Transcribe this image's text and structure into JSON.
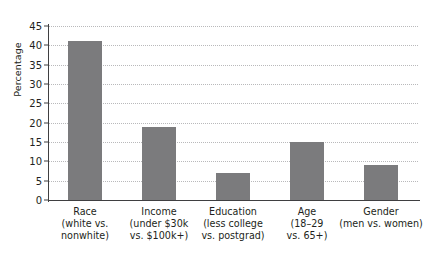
{
  "chart_data": {
    "type": "bar",
    "title": "",
    "xlabel": "",
    "ylabel": "Percentage",
    "ylim": [
      0,
      45
    ],
    "ytick_step": 5,
    "yticks": [
      "0",
      "5",
      "10",
      "15",
      "20",
      "25",
      "30",
      "35",
      "40",
      "45"
    ],
    "grid": true,
    "legend": "none",
    "bar_color": "#7b7b7d",
    "axis_color": "#3f3f41",
    "gridline_color": "#b9b9bb",
    "categories": [
      "Race (white vs. nonwhite)",
      "Income (under $30k vs. $100k+)",
      "Education (less college vs. postgrad)",
      "Age (18–29 vs. 65+)",
      "Gender (men vs. women)"
    ],
    "values": [
      41,
      19,
      7,
      15,
      9
    ],
    "category_labels": [
      {
        "lines": [
          "Race",
          "(white vs.",
          "nonwhite)"
        ]
      },
      {
        "lines": [
          "Income",
          "(under $30k",
          "vs. $100k+)"
        ]
      },
      {
        "lines": [
          "Education",
          "(less college",
          "vs. postgrad)"
        ]
      },
      {
        "lines": [
          "Age",
          "(18–29",
          "vs. 65+)"
        ]
      },
      {
        "lines": [
          "Gender",
          "(men vs. women)"
        ]
      }
    ]
  }
}
